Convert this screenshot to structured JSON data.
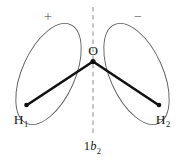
{
  "figure": {
    "caption_prefix": "1",
    "caption_symbol": "b",
    "caption_subscript": "2",
    "background_color": "#ffffff",
    "outline_color": "#58595b",
    "bond_color": "#111111",
    "axis_color": "#9b9b9b"
  },
  "orbital": {
    "lobes": [
      {
        "sign_label": "+",
        "side": "left",
        "sign_x": 48,
        "sign_y": 21,
        "ellipse": {
          "cx": 48.5,
          "cy": 74,
          "rx": 26.5,
          "ry": 54,
          "rotation": 24
        }
      },
      {
        "sign_label": "−",
        "side": "right",
        "sign_x": 138,
        "sign_y": 21,
        "ellipse": {
          "cx": 136.5,
          "cy": 74,
          "rx": 26.5,
          "ry": 54,
          "rotation": -24
        }
      }
    ]
  },
  "molecule": {
    "central_atom": {
      "label": "O",
      "label_x": 93,
      "label_y": 55,
      "vertex_x": 93,
      "vertex_y": 61.5
    },
    "hydrogens": [
      {
        "label": "H",
        "subscript": "1",
        "dot_x": 26.5,
        "dot_y": 105,
        "label_x": 21,
        "label_y": 124
      },
      {
        "label": "H",
        "subscript": "2",
        "dot_x": 159,
        "dot_y": 105,
        "label_x": 153,
        "label_y": 124
      }
    ]
  },
  "symmetry_axis": {
    "name": "c2-axis",
    "x": 93,
    "y_top": 7,
    "y_bottom": 133
  }
}
